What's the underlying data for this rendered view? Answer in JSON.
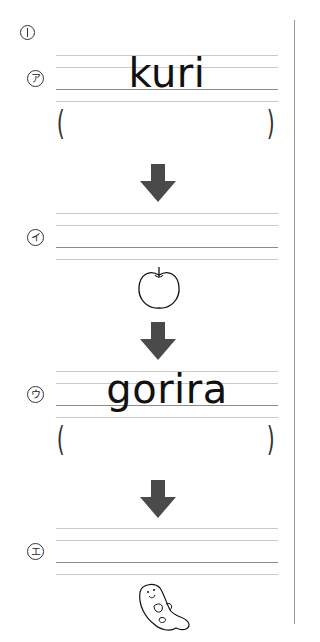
{
  "question_number": "①",
  "arrow_color": "#4a4a4a",
  "items": [
    {
      "label": "ア",
      "word": "kuri",
      "answer": "",
      "has_parens": true
    },
    {
      "label": "イ",
      "word": "",
      "answer": "",
      "has_parens": false,
      "picture": "apple-icon"
    },
    {
      "label": "ウ",
      "word": "gorira",
      "answer": "",
      "has_parens": true
    },
    {
      "label": "エ",
      "word": "",
      "answer": "",
      "has_parens": false,
      "picture": "sea-otter-icon"
    }
  ]
}
